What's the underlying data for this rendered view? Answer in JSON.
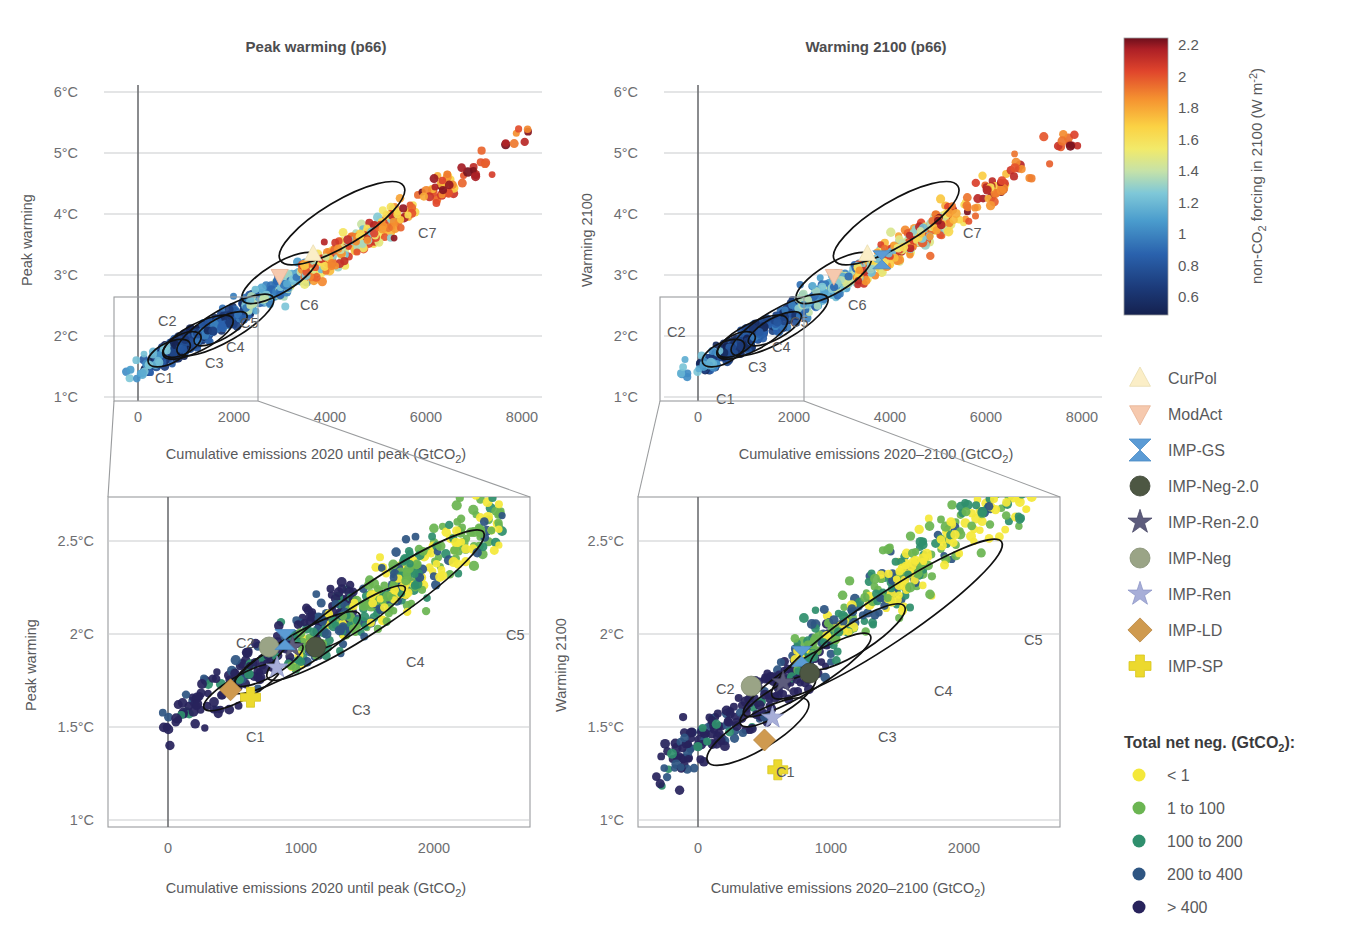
{
  "figure": {
    "panels": [
      {
        "id": "peak-warming-overview",
        "title": "Peak warming (p66)",
        "ylabel": "Peak warming",
        "xlabel": "Cumulative emissions 2020 until peak (GtCO2)",
        "xlabel_rich": "Cumulative emissions 2020 until peak (GtCO",
        "xlabel_sub": "2",
        "xlabel_tail": ")",
        "yticks": [
          "1°C",
          "2°C",
          "3°C",
          "4°C",
          "5°C",
          "6°C"
        ],
        "xticks": [
          "0",
          "2000",
          "4000",
          "6000",
          "8000"
        ],
        "cluster_labels": [
          "C1",
          "C2",
          "C3",
          "C4",
          "C5",
          "C6",
          "C7"
        ]
      },
      {
        "id": "warming-2100-overview",
        "title": "Warming 2100 (p66)",
        "ylabel": "Warming 2100",
        "xlabel": "Cumulative emissions 2020–2100 (GtCO2)",
        "xlabel_rich": "Cumulative emissions 2020–2100 (GtCO",
        "xlabel_sub": "2",
        "xlabel_tail": ")",
        "yticks": [
          "1°C",
          "2°C",
          "3°C",
          "4°C",
          "5°C",
          "6°C"
        ],
        "xticks": [
          "0",
          "2000",
          "4000",
          "6000",
          "8000"
        ],
        "cluster_labels": [
          "C1",
          "C2",
          "C3",
          "C4",
          "C5",
          "C6",
          "C7"
        ]
      },
      {
        "id": "peak-warming-zoom",
        "title": "",
        "ylabel": "Peak warming",
        "xlabel": "Cumulative emissions 2020 until peak (GtCO2)",
        "xlabel_rich": "Cumulative emissions 2020 until peak (GtCO",
        "xlabel_sub": "2",
        "xlabel_tail": ")",
        "yticks": [
          "1°C",
          "1.5°C",
          "2°C",
          "2.5°C"
        ],
        "xticks": [
          "0",
          "1000",
          "2000"
        ],
        "cluster_labels": [
          "C1",
          "C2",
          "C3",
          "C4",
          "C5"
        ]
      },
      {
        "id": "warming-2100-zoom",
        "title": "",
        "ylabel": "Warming 2100",
        "xlabel": "Cumulative emissions 2020–2100 (GtCO2)",
        "xlabel_rich": "Cumulative emissions 2020–2100 (GtCO",
        "xlabel_sub": "2",
        "xlabel_tail": ")",
        "yticks": [
          "1°C",
          "1.5°C",
          "2°C",
          "2.5°C"
        ],
        "xticks": [
          "0",
          "1000",
          "2000"
        ],
        "cluster_labels": [
          "C1",
          "C2",
          "C3",
          "C4",
          "C5"
        ]
      }
    ],
    "colorbar": {
      "title_head": "non-CO",
      "title_sub": "2",
      "title_mid": " forcing in 2100 (W m",
      "title_sup": "-2",
      "title_tail": ")",
      "title_plain": "non-CO2 forcing in 2100 (W m-2)",
      "ticks": [
        "2.2",
        "2",
        "1.8",
        "1.6",
        "1.4",
        "1.2",
        "1",
        "0.8",
        "0.6"
      ],
      "min": 0.5,
      "max": 2.3,
      "stops": [
        {
          "pos": 0.0,
          "color": "#15214f"
        },
        {
          "pos": 0.1,
          "color": "#1c3b7a"
        },
        {
          "pos": 0.22,
          "color": "#2a62ad"
        },
        {
          "pos": 0.34,
          "color": "#4a9ccd"
        },
        {
          "pos": 0.44,
          "color": "#7fc8d8"
        },
        {
          "pos": 0.52,
          "color": "#c6e2a8"
        },
        {
          "pos": 0.6,
          "color": "#f2ea6a"
        },
        {
          "pos": 0.68,
          "color": "#fbd244"
        },
        {
          "pos": 0.78,
          "color": "#f59230"
        },
        {
          "pos": 0.88,
          "color": "#e0452c"
        },
        {
          "pos": 0.96,
          "color": "#ac1f26"
        },
        {
          "pos": 1.0,
          "color": "#6d0f1c"
        }
      ]
    },
    "marker_legend": {
      "items": [
        {
          "label": "CurPol",
          "shape": "triangle-up",
          "color": "#fbeec7",
          "stroke": "#e8ddb0"
        },
        {
          "label": "ModAct",
          "shape": "triangle-down",
          "color": "#f6c9ae",
          "stroke": "#e9b294"
        },
        {
          "label": "IMP-GS",
          "shape": "hourglass",
          "color": "#5b9bd5",
          "stroke": "#4a8bc4"
        },
        {
          "label": "IMP-Neg-2.0",
          "shape": "circle",
          "color": "#4d5743",
          "stroke": "#3c4435"
        },
        {
          "label": "IMP-Ren-2.0",
          "shape": "star",
          "color": "#5d5c7d",
          "stroke": "#4b4a68"
        },
        {
          "label": "IMP-Neg",
          "shape": "circle",
          "color": "#9aa486",
          "stroke": "#848e72"
        },
        {
          "label": "IMP-Ren",
          "shape": "star",
          "color": "#a7aed8",
          "stroke": "#8e97c8"
        },
        {
          "label": "IMP-LD",
          "shape": "diamond",
          "color": "#cf9a4f",
          "stroke": "#b88540"
        },
        {
          "label": "IMP-SP",
          "shape": "plus",
          "color": "#ecd92e",
          "stroke": "#d8c520"
        }
      ]
    },
    "netneg_legend": {
      "title_head": "Total net neg. (GtCO",
      "title_sub": "2",
      "title_tail": "):",
      "title_plain": "Total net neg. (GtCO2):",
      "items": [
        {
          "label": "< 1",
          "color": "#f4e83a"
        },
        {
          "label": "1 to 100",
          "color": "#6bb552"
        },
        {
          "label": "100 to 200",
          "color": "#2f8f6d"
        },
        {
          "label": "200 to 400",
          "color": "#2e5582"
        },
        {
          "label": "> 400",
          "color": "#28235c"
        }
      ]
    }
  },
  "chart_data": {
    "type": "scatter",
    "panel_count": 4,
    "overview_axes": {
      "xlim": [
        -600,
        8600
      ],
      "ylim": [
        0.85,
        6.25
      ],
      "xticks": [
        0,
        2000,
        4000,
        6000,
        8000
      ],
      "yticks": [
        1,
        2,
        3,
        4,
        5,
        6
      ],
      "grid": "horizontal",
      "zoom_box": {
        "x": [
          -600,
          2550
        ],
        "y": [
          0.85,
          2.68
        ]
      }
    },
    "zoom_axes": {
      "xlim": [
        -420,
        2520
      ],
      "ylim": [
        0.82,
        2.68
      ],
      "xticks": [
        0,
        1000,
        2000
      ],
      "yticks": [
        1,
        1.5,
        2,
        2.5
      ],
      "grid": "horizontal"
    },
    "colorbar_variable": "non-CO2 forcing in 2100 (W m-2)",
    "colorbar_range": [
      0.5,
      2.3
    ],
    "netneg_variable": "Total net neg. (GtCO2)",
    "ellipses_overview": [
      {
        "label": "C1",
        "cx": 650,
        "cy": 1.72,
        "rx": 480,
        "ry": 0.17,
        "angle": -26
      },
      {
        "label": "C2",
        "cx": 920,
        "cy": 1.86,
        "rx": 430,
        "ry": 0.16,
        "angle": -27
      },
      {
        "label": "C3",
        "cx": 1250,
        "cy": 1.98,
        "rx": 820,
        "ry": 0.22,
        "angle": -28
      },
      {
        "label": "C4",
        "cx": 1720,
        "cy": 2.12,
        "rx": 620,
        "ry": 0.17,
        "angle": -29
      },
      {
        "label": "C5",
        "cx": 1820,
        "cy": 2.18,
        "rx": 1150,
        "ry": 0.26,
        "angle": -30
      },
      {
        "label": "C6",
        "cx": 2950,
        "cy": 2.95,
        "rx": 900,
        "ry": 0.24,
        "angle": -31
      },
      {
        "label": "C7",
        "cx": 4250,
        "cy": 3.85,
        "rx": 1500,
        "ry": 0.36,
        "angle": -31
      }
    ],
    "special_markers_overview_left": [
      {
        "name": "CurPol",
        "x": 3650,
        "y": 3.35
      },
      {
        "name": "ModAct",
        "x": 2950,
        "y": 2.98
      }
    ],
    "special_markers_overview_right": [
      {
        "name": "CurPol",
        "x": 3650,
        "y": 3.35
      },
      {
        "name": "ModAct",
        "x": 2950,
        "y": 2.98
      },
      {
        "name": "IMP-GS",
        "x": 3950,
        "y": 3.25
      }
    ],
    "special_markers_zoom_left": [
      {
        "name": "IMP-Neg",
        "x": 760,
        "y": 1.93
      },
      {
        "name": "IMP-Ren-2.0",
        "x": 935,
        "y": 1.93
      },
      {
        "name": "IMP-Neg-2.0",
        "x": 1110,
        "y": 1.93
      },
      {
        "name": "IMP-Ren",
        "x": 820,
        "y": 1.82
      },
      {
        "name": "IMP-GS",
        "x": 880,
        "y": 1.97
      },
      {
        "name": "IMP-LD",
        "x": 470,
        "y": 1.7
      },
      {
        "name": "IMP-SP",
        "x": 620,
        "y": 1.66
      }
    ],
    "special_markers_zoom_right": [
      {
        "name": "IMP-GS",
        "x": 780,
        "y": 1.88
      },
      {
        "name": "IMP-Neg-2.0",
        "x": 840,
        "y": 1.79
      },
      {
        "name": "IMP-Ren-2.0",
        "x": 640,
        "y": 1.74
      },
      {
        "name": "IMP-Neg",
        "x": 400,
        "y": 1.72
      },
      {
        "name": "IMP-Ren",
        "x": 560,
        "y": 1.55
      },
      {
        "name": "IMP-LD",
        "x": 500,
        "y": 1.43
      },
      {
        "name": "IMP-SP",
        "x": 600,
        "y": 1.27
      }
    ]
  }
}
